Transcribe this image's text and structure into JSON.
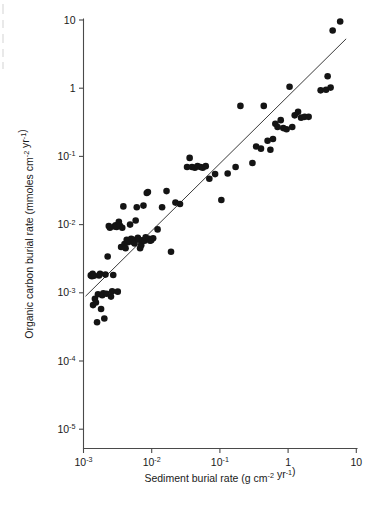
{
  "chart_data": {
    "type": "scatter",
    "title": "",
    "xlabel": "Sediment burial rate (g cm⁻² yr⁻¹)",
    "ylabel": "Organic carbon burial rate (mmoles cm⁻² yr⁻¹)",
    "xscale": "log",
    "yscale": "log",
    "xlim": [
      0.001,
      10
    ],
    "ylim": [
      1e-05,
      10
    ],
    "grid": false,
    "legend": null,
    "xticks": [
      0.001,
      0.01,
      0.1,
      1,
      10
    ],
    "xtick_labels": [
      "10⁻³",
      "10⁻²",
      "10⁻¹",
      "1",
      "10"
    ],
    "yticks": [
      1e-05,
      0.0001,
      0.001,
      0.01,
      0.1,
      1,
      10
    ],
    "ytick_labels": [
      "10⁻⁵",
      "10⁻⁴",
      "10⁻³",
      "10⁻²",
      "10⁻¹",
      "1",
      "10"
    ],
    "marker": "filled-circle",
    "marker_color": "#141414",
    "fit_line": {
      "label": "regression line",
      "color": "#3a3a3a",
      "x_start": 0.00107,
      "y_start": 0.00089,
      "x_end": 7.1,
      "y_end": 5.3
    },
    "x": [
      0.00128,
      0.00133,
      0.00136,
      0.00138,
      0.00142,
      0.00147,
      0.00152,
      0.00158,
      0.00163,
      0.00169,
      0.00175,
      0.00181,
      0.00188,
      0.00195,
      0.00202,
      0.0021,
      0.00218,
      0.00226,
      0.00235,
      0.00244,
      0.00253,
      0.00263,
      0.00273,
      0.00284,
      0.00295,
      0.00306,
      0.00318,
      0.0033,
      0.00343,
      0.00356,
      0.0037,
      0.00384,
      0.00399,
      0.00414,
      0.0043,
      0.00447,
      0.00464,
      0.00482,
      0.005,
      0.0052,
      0.0054,
      0.0056,
      0.00582,
      0.00604,
      0.00627,
      0.00651,
      0.00676,
      0.00702,
      0.00729,
      0.00757,
      0.00786,
      0.00816,
      0.00847,
      0.0088,
      0.00913,
      0.00948,
      0.00985,
      0.0105,
      0.0122,
      0.0142,
      0.0165,
      0.0192,
      0.0223,
      0.026,
      0.033,
      0.036,
      0.039,
      0.043,
      0.047,
      0.052,
      0.056,
      0.062,
      0.07,
      0.085,
      0.105,
      0.13,
      0.17,
      0.2,
      0.3,
      0.34,
      0.4,
      0.44,
      0.5,
      0.55,
      0.6,
      0.65,
      0.7,
      0.78,
      0.85,
      0.95,
      1.05,
      1.15,
      1.25,
      1.4,
      1.55,
      1.75,
      2.0,
      3.0,
      3.6,
      3.8,
      4.2,
      4.5,
      5.8
    ],
    "y": [
      0.0018,
      0.00175,
      0.0019,
      0.00066,
      0.00178,
      0.00082,
      0.00072,
      0.00037,
      0.00095,
      0.0018,
      0.0019,
      0.00058,
      0.00092,
      0.00098,
      0.00042,
      0.00185,
      0.00097,
      0.0034,
      0.0095,
      0.009,
      0.00088,
      0.00105,
      0.00182,
      0.0094,
      0.0098,
      0.0092,
      0.00104,
      0.011,
      0.0096,
      0.0047,
      0.009,
      0.0185,
      0.0052,
      0.0045,
      0.006,
      0.0055,
      0.0058,
      0.01,
      0.0062,
      0.0056,
      0.006,
      0.0053,
      0.0115,
      0.018,
      0.0064,
      0.006,
      0.0045,
      0.005,
      0.0059,
      0.019,
      0.0058,
      0.0065,
      0.029,
      0.03,
      0.0062,
      0.0058,
      0.0059,
      0.0063,
      0.0085,
      0.018,
      0.031,
      0.004,
      0.021,
      0.02,
      0.07,
      0.095,
      0.07,
      0.068,
      0.072,
      0.07,
      0.068,
      0.072,
      0.047,
      0.055,
      0.023,
      0.056,
      0.07,
      0.55,
      0.08,
      0.14,
      0.13,
      0.55,
      0.17,
      0.125,
      0.18,
      0.3,
      0.27,
      0.34,
      0.26,
      0.25,
      1.05,
      0.27,
      0.4,
      0.45,
      0.37,
      0.38,
      0.38,
      0.93,
      0.95,
      1.5,
      1.02,
      7.0,
      9.5
    ]
  }
}
